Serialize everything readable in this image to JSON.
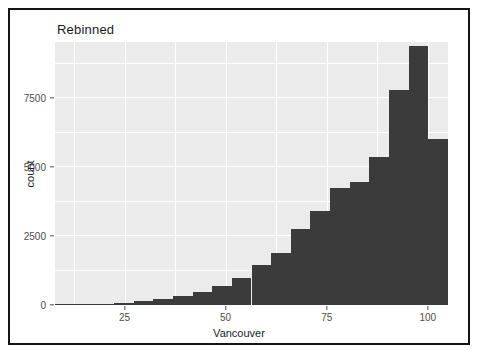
{
  "figure": {
    "title": "Rebinned",
    "background": "#ffffff",
    "border_color": "#151515",
    "panel_background": "#ebebeb",
    "grid_color": "#ffffff",
    "bar_color": "#3b3b3b",
    "axis_text_color": "#4d4d4d"
  },
  "chart_data": {
    "type": "bar",
    "title": "Rebinned",
    "xlabel": "Vancouver",
    "ylabel": "count",
    "grid": true,
    "legend": "none",
    "xlim": [
      7.8,
      105.0
    ],
    "ylim": [
      0,
      9530
    ],
    "xticks": [
      25,
      50,
      75,
      100
    ],
    "xtick_labels": [
      "25",
      "50",
      "75",
      "100"
    ],
    "yticks": [
      0,
      2500,
      5000,
      7500
    ],
    "ytick_labels": [
      "0",
      "2500",
      "5000",
      "7500"
    ],
    "bin_width": 4.86,
    "bin_starts": [
      7.8,
      12.66,
      17.52,
      22.38,
      27.24,
      32.1,
      36.96,
      41.82,
      46.68,
      51.54,
      56.4,
      61.26,
      66.12,
      70.98,
      75.84,
      80.7,
      85.56,
      90.42,
      95.28,
      100.14
    ],
    "bin_centers": [
      10.23,
      15.09,
      19.95,
      24.81,
      29.67,
      34.53,
      39.39,
      44.25,
      49.11,
      53.97,
      58.83,
      63.69,
      68.55,
      73.41,
      78.27,
      83.13,
      87.99,
      92.85,
      97.71,
      102.57
    ],
    "categories": [
      "7.8-12.7",
      "12.7-17.5",
      "17.5-22.4",
      "22.4-27.2",
      "27.2-32.1",
      "32.1-37.0",
      "37.0-41.8",
      "41.8-46.7",
      "46.7-51.5",
      "51.5-56.4",
      "56.4-61.3",
      "61.3-66.1",
      "66.1-71.0",
      "71.0-75.8",
      "75.8-80.7",
      "80.7-85.6",
      "85.6-90.4",
      "90.4-95.3",
      "95.3-100.1",
      "100.1-105.0"
    ],
    "values": [
      10,
      20,
      40,
      70,
      130,
      210,
      330,
      480,
      700,
      980,
      1450,
      1900,
      2750,
      3400,
      4250,
      4450,
      5350,
      7800,
      9400,
      6000
    ]
  }
}
